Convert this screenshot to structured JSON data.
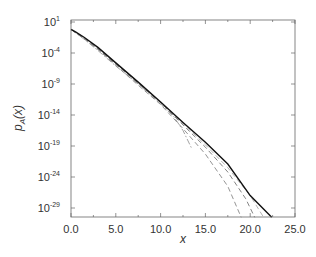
{
  "chart_data": {
    "type": "line",
    "title": "",
    "xlabel": "x",
    "ylabel": "p_A(x)",
    "ylabel_base": "p",
    "ylabel_sub": "A",
    "ylabel_arg": "(x)",
    "xlim": [
      0,
      25
    ],
    "ylim_log10": [
      -30.5,
      1
    ],
    "yscale": "log",
    "grid": false,
    "legend": null,
    "x_ticks": [
      {
        "value": 0,
        "label": "0.0"
      },
      {
        "value": 5,
        "label": "5.0"
      },
      {
        "value": 10,
        "label": "10.0"
      },
      {
        "value": 15,
        "label": "15.0"
      },
      {
        "value": 20,
        "label": "20.0"
      },
      {
        "value": 25,
        "label": "25.0"
      }
    ],
    "y_ticks": [
      {
        "exp": 1,
        "base": "10",
        "sup": "1"
      },
      {
        "exp": -4,
        "base": "10",
        "sup": "-4"
      },
      {
        "exp": -9,
        "base": "10",
        "sup": "-9"
      },
      {
        "exp": -14,
        "base": "10",
        "sup": "-14"
      },
      {
        "exp": -19,
        "base": "10",
        "sup": "-19"
      },
      {
        "exp": -24,
        "base": "10",
        "sup": "-24"
      },
      {
        "exp": -29,
        "base": "10",
        "sup": "-29"
      }
    ],
    "series": [
      {
        "name": "solid",
        "style": "solid",
        "color": "#111111",
        "x": [
          0,
          0.5,
          1.5,
          3,
          5,
          7.5,
          10,
          12.5,
          15,
          17.5,
          20,
          22.4
        ],
        "log10_y": [
          -0.2,
          -0.6,
          -1.5,
          -3.1,
          -5.6,
          -8.7,
          -11.9,
          -15.2,
          -18.4,
          -21.9,
          -27.0,
          -30.5
        ]
      },
      {
        "name": "dashed-1",
        "style": "dashed",
        "color": "#777777",
        "x": [
          0,
          1.5,
          3,
          5,
          7.5,
          10,
          12.5,
          15,
          17.5,
          19.5,
          20.5
        ],
        "log10_y": [
          -0.2,
          -1.6,
          -3.3,
          -5.8,
          -8.9,
          -12.0,
          -15.6,
          -19.2,
          -23.2,
          -27.5,
          -30.5
        ]
      },
      {
        "name": "dashed-2",
        "style": "dashed",
        "color": "#888888",
        "x": [
          0,
          1.5,
          3,
          5,
          7.5,
          10,
          12.5,
          15,
          17.5,
          19.0
        ],
        "log10_y": [
          -0.2,
          -1.7,
          -3.4,
          -6.0,
          -9.2,
          -12.3,
          -16.2,
          -20.3,
          -25.5,
          -30.5
        ]
      },
      {
        "name": "dash-dot",
        "style": "dashdot",
        "color": "#999999",
        "x": [
          0,
          1.5,
          3,
          5,
          7.5,
          10,
          11.5,
          12.5,
          13.5
        ],
        "log10_y": [
          -0.2,
          -1.8,
          -3.6,
          -6.1,
          -9.0,
          -12.2,
          -14.3,
          -16.5,
          -19.5
        ]
      },
      {
        "name": "dashed-3",
        "style": "dashed",
        "color": "#aaaaaa",
        "x": [
          0,
          3,
          7.5,
          10,
          12.5,
          15,
          17.5,
          20,
          21.5
        ],
        "log10_y": [
          -0.2,
          -3.4,
          -8.8,
          -12.0,
          -15.4,
          -18.8,
          -22.5,
          -27.0,
          -30.5
        ]
      }
    ]
  }
}
